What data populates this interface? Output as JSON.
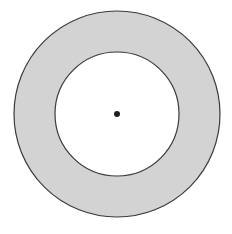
{
  "diagram": {
    "type": "annulus",
    "canvas": {
      "width": 232,
      "height": 234,
      "background": "#ffffff"
    },
    "center": {
      "x": 117,
      "y": 114
    },
    "outer_circle": {
      "radius": 103,
      "stroke": "#3a3a3a",
      "stroke_width": 1.2
    },
    "inner_circle": {
      "radius": 62,
      "stroke": "#3a3a3a",
      "stroke_width": 1.2,
      "fill": "#ffffff"
    },
    "ring_fill": "#d3d3d3",
    "center_dot": {
      "radius": 3,
      "fill": "#1e1e1e"
    }
  }
}
